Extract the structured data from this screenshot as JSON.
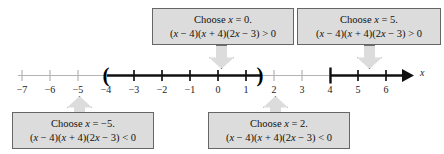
{
  "figure": {
    "type": "number-line-sign-chart",
    "axis_variable": "x"
  },
  "number_line": {
    "tick_labels": [
      "−7",
      "−6",
      "−5",
      "−4",
      "−3",
      "−2",
      "−1",
      "0",
      "1",
      "2",
      "3",
      "4",
      "5",
      "6"
    ],
    "tick_values": [
      -7,
      -6,
      -5,
      -4,
      -3,
      -2,
      -1,
      0,
      1,
      2,
      3,
      4,
      5,
      6
    ],
    "axis_label": "x",
    "open_paren_left": "(",
    "close_paren_right": ")",
    "shaded_intervals": [
      {
        "from": -4,
        "to": 1.5,
        "left_endpoint": "open",
        "right_endpoint": "open"
      },
      {
        "from": 4,
        "to": 6.7,
        "left_endpoint": "open",
        "right_endpoint": "arrow"
      }
    ]
  },
  "callouts": {
    "top_middle": {
      "line1": "Choose x = 0.",
      "line2": "(x − 4)(x + 4)(2x − 3) > 0",
      "test_value": 0,
      "sign": ">"
    },
    "top_right": {
      "line1": "Choose x = 5.",
      "line2": "(x − 4)(x + 4)(2x − 3) > 0",
      "test_value": 5,
      "sign": ">"
    },
    "bottom_left": {
      "line1": "Choose x = −5.",
      "line2": "(x − 4)(x + 4)(2x − 3) < 0",
      "test_value": -5,
      "sign": "<"
    },
    "bottom_middle": {
      "line1": "Choose x = 2.",
      "line2": "(x − 4)(x + 4)(2x − 3) < 0",
      "test_value": 2,
      "sign": "<"
    }
  },
  "colors": {
    "box_fill": "#dcdcdc",
    "box_border": "#666666",
    "line_light": "#b0b0b0",
    "line_dark": "#111111",
    "text": "#111111"
  }
}
